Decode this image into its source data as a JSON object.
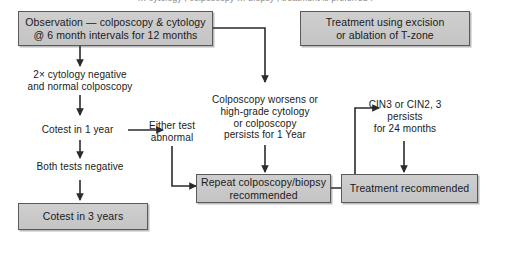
{
  "figure": {
    "clipped_header_text": "… cytology , colposcopy … biopsy , treatment is preferred .",
    "background_color": "#ffffff",
    "box_fill_color": "#c9c9c9",
    "box_border_color": "#5a5a5a",
    "text_color": "#1a1a1a",
    "connector_color": "#2b2b2b"
  },
  "nodes": {
    "observation": {
      "label": "Observation — colposcopy & cytology\n@ 6 month intervals for 12 months",
      "type": "box"
    },
    "treatment_excision": {
      "label": "Treatment using excision\nor ablation of T-zone",
      "type": "box"
    },
    "two_cytology_negative": {
      "label": "2× cytology negative\nand normal colposcopy",
      "type": "plain"
    },
    "cotest_1_year": {
      "label": "Cotest in 1 year",
      "type": "plain"
    },
    "either_test_abnormal": {
      "label": "Either test\nabnormal",
      "type": "plain"
    },
    "both_tests_negative": {
      "label": "Both tests negative",
      "type": "plain"
    },
    "cotest_3_years": {
      "label": "Cotest in 3 years",
      "type": "box"
    },
    "colposcopy_worsens": {
      "label": "Colposcopy worsens or\nhigh-grade cytology\nor colposcopy\npersists for 1 Year",
      "type": "plain"
    },
    "cin3_or_cin2": {
      "label": "CIN3 or CIN2, 3\npersists\nfor 24 months",
      "type": "plain"
    },
    "repeat_colposcopy": {
      "label": "Repeat colposcopy/biopsy\nrecommended",
      "type": "box"
    },
    "treatment_recommended": {
      "label": "Treatment recommended",
      "type": "box"
    }
  },
  "edges": [
    {
      "from": "observation",
      "to": "two_cytology_negative",
      "style": "straight-down"
    },
    {
      "from": "observation",
      "to": "colposcopy_worsens",
      "style": "elbow-right-down"
    },
    {
      "from": "two_cytology_negative",
      "to": "cotest_1_year",
      "style": "straight-down"
    },
    {
      "from": "cotest_1_year",
      "to": "either_test_abnormal",
      "style": "straight-right"
    },
    {
      "from": "cotest_1_year",
      "to": "both_tests_negative",
      "style": "straight-down"
    },
    {
      "from": "both_tests_negative",
      "to": "cotest_3_years",
      "style": "straight-down"
    },
    {
      "from": "either_test_abnormal",
      "to": "repeat_colposcopy",
      "style": "elbow-down-right"
    },
    {
      "from": "colposcopy_worsens",
      "to": "repeat_colposcopy",
      "style": "straight-down"
    },
    {
      "from": "repeat_colposcopy",
      "to": "cin3_or_cin2",
      "style": "elbow-up-right"
    },
    {
      "from": "cin3_or_cin2",
      "to": "treatment_recommended",
      "style": "straight-down"
    }
  ]
}
